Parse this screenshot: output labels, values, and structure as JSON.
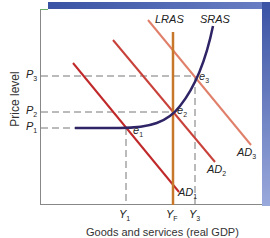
{
  "diagram": {
    "y_axis_label": "Price level",
    "x_axis_label": "Goods and services (real GDP)",
    "price_levels": [
      {
        "main": "P",
        "sub": "3"
      },
      {
        "main": "P",
        "sub": "2"
      },
      {
        "main": "P",
        "sub": "1"
      }
    ],
    "output_levels": [
      {
        "main": "Y",
        "sub": "1"
      },
      {
        "main": "Y",
        "sub": "F"
      },
      {
        "main": "Y",
        "sub": "3"
      }
    ],
    "curves": {
      "lras": "LRAS",
      "sras": "SRAS",
      "ad1": {
        "main": "AD",
        "sub": "1"
      },
      "ad2": {
        "main": "AD",
        "sub": "2"
      },
      "ad3": {
        "main": "AD",
        "sub": "3"
      }
    },
    "equilibria": [
      {
        "main": "e",
        "sub": "1"
      },
      {
        "main": "e",
        "sub": "2"
      },
      {
        "main": "e",
        "sub": "3"
      }
    ],
    "colors": {
      "lras": "#c8782a",
      "sras": "#2e2466",
      "ad1": "#c0282a",
      "ad2": "#c8413a",
      "ad3": "#e0806a",
      "band": "#3a53a4",
      "dash": "#777777"
    }
  }
}
